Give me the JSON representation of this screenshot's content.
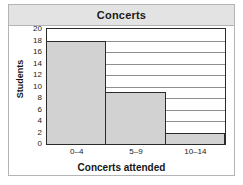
{
  "card": {
    "title": "Concerts"
  },
  "chart_data": {
    "type": "bar",
    "title": "Concerts",
    "xlabel": "Concerts attended",
    "ylabel": "Students",
    "categories": [
      "0–4",
      "5–9",
      "10–14"
    ],
    "values": [
      18,
      9,
      2
    ],
    "ylim": [
      0,
      20
    ],
    "ytick_labels": [
      "20",
      "18",
      "16",
      "14",
      "12",
      "10",
      "8",
      "6",
      "4",
      "2",
      "0"
    ],
    "ytick_values": [
      20,
      18,
      16,
      14,
      12,
      10,
      8,
      6,
      4,
      2,
      0
    ],
    "ytick_step": 2,
    "grid": true,
    "legend": null,
    "bar_color": "#d2d2d2",
    "bar_edge_color": "#2b2b2b",
    "gridline_color": "#8f8f8f",
    "axis_color": "#2b2b2b",
    "title_band_color": "#e3e3e3",
    "card_border_color": "#b4b4b4"
  }
}
